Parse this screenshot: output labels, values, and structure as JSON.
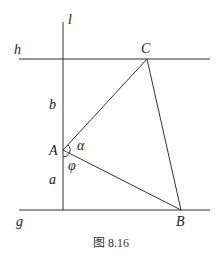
{
  "figure": {
    "caption": "图 8.16",
    "lines": {
      "l": "l",
      "h": "h",
      "g": "g"
    },
    "points": {
      "A": "A",
      "B": "B",
      "C": "C"
    },
    "segments": {
      "a": "a",
      "b": "b"
    },
    "angles": {
      "alpha": "α",
      "phi": "φ"
    }
  }
}
